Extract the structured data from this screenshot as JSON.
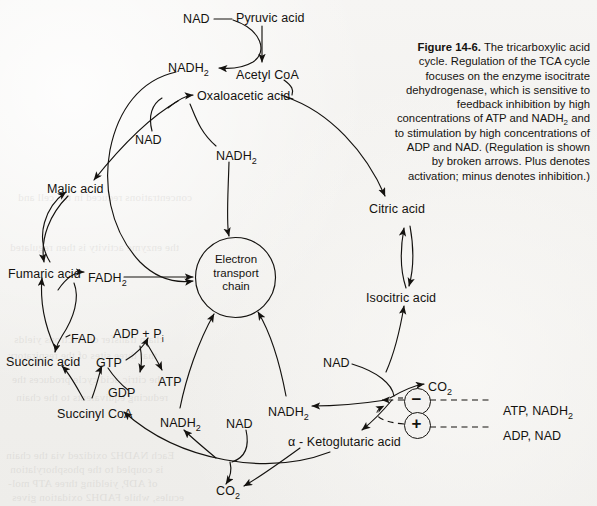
{
  "figure": {
    "number": "Figure 14-6.",
    "caption_rest": " The tricarboxylic acid cycle. Regulation of the TCA cycle focuses on the enzyme isocitrate dehydrogenase, which is sensitive to feedback inhibition by high concentrations of ATP and NADH2 and to stimulation by high concentrations of ADP and NAD. (Regulation is shown by broken arrows. Plus denotes activation; minus denotes inhibition.)",
    "caption_html": "<b>Figure 14-6.</b> The tricarboxylic acid cycle. Regulation of the TCA cycle focuses on the enzyme isocitrate dehydrogenase, which is sensitive to feedback inhibition by high concentrations of ATP and NADH<sub>2</sub> and to stimulation by high concentrations of ADP and NAD. (Regulation is shown by broken arrows. Plus denotes activation; minus denotes inhibition.)"
  },
  "hub": {
    "label_line1": "Electron",
    "label_line2": "transport",
    "label_line3": "chain"
  },
  "metabolites": [
    {
      "id": "pyruvic-acid",
      "text": "Pyruvic acid",
      "x": 236,
      "y": 12,
      "sub": ""
    },
    {
      "id": "nad-pyruvate",
      "text": "NAD",
      "x": 183,
      "y": 13,
      "sub": ""
    },
    {
      "id": "acetyl-coa",
      "text": "Acetyl CoA",
      "x": 236,
      "y": 69,
      "sub": ""
    },
    {
      "id": "nadh2-pyruvate",
      "text": "NADH",
      "x": 168,
      "y": 62,
      "sub": "2"
    },
    {
      "id": "oxaloacetic-acid",
      "text": "Oxaloacetic acid",
      "x": 197,
      "y": 90,
      "sub": ""
    },
    {
      "id": "nad-malate",
      "text": "NAD",
      "x": 135,
      "y": 134,
      "sub": ""
    },
    {
      "id": "nadh2-malate",
      "text": "NADH",
      "x": 216,
      "y": 150,
      "sub": "2"
    },
    {
      "id": "malic-acid",
      "text": "Malic acid",
      "x": 47,
      "y": 183,
      "sub": ""
    },
    {
      "id": "citric-acid",
      "text": "Citric acid",
      "x": 369,
      "y": 203,
      "sub": ""
    },
    {
      "id": "fumaric-acid",
      "text": "Fumaric acid",
      "x": 8,
      "y": 268,
      "sub": ""
    },
    {
      "id": "fadh2",
      "text": "FADH",
      "x": 88,
      "y": 272,
      "sub": "2"
    },
    {
      "id": "isocitric-acid",
      "text": "Isocitric acid",
      "x": 366,
      "y": 292,
      "sub": ""
    },
    {
      "id": "fad",
      "text": "FAD",
      "x": 71,
      "y": 333,
      "sub": ""
    },
    {
      "id": "adp-pi",
      "text": "ADP + P",
      "x": 113,
      "y": 328,
      "sub": "i"
    },
    {
      "id": "succinic-acid",
      "text": "Succinic acid",
      "x": 6,
      "y": 356,
      "sub": ""
    },
    {
      "id": "gtp",
      "text": "GTP",
      "x": 96,
      "y": 357,
      "sub": ""
    },
    {
      "id": "atp",
      "text": "ATP",
      "x": 158,
      "y": 376,
      "sub": ""
    },
    {
      "id": "gdp",
      "text": "GDP",
      "x": 108,
      "y": 387,
      "sub": ""
    },
    {
      "id": "nad-isocitrate",
      "text": "NAD",
      "x": 323,
      "y": 357,
      "sub": ""
    },
    {
      "id": "co2-isocitrate",
      "text": "CO",
      "x": 428,
      "y": 381,
      "sub": "2"
    },
    {
      "id": "succinyl-coa",
      "text": "Succinyl CoA",
      "x": 57,
      "y": 408,
      "sub": ""
    },
    {
      "id": "nadh2-succinyl",
      "text": "NADH",
      "x": 160,
      "y": 417,
      "sub": "2"
    },
    {
      "id": "nad-ketoglutarate",
      "text": "NAD",
      "x": 226,
      "y": 418,
      "sub": ""
    },
    {
      "id": "nadh2-ketoglutarate",
      "text": "NADH",
      "x": 268,
      "y": 406,
      "sub": "2"
    },
    {
      "id": "alpha-ketoglutaric",
      "text": "α - Ketoglutaric acid",
      "x": 288,
      "y": 436,
      "sub": ""
    },
    {
      "id": "co2-ketoglutarate",
      "text": "CO",
      "x": 216,
      "y": 485,
      "sub": "2"
    }
  ],
  "regulation": {
    "inhibition": {
      "sign": "−",
      "label": "ATP, NADH",
      "label_sub": "2",
      "circle_x": 416,
      "circle_y": 400,
      "label_x": 503,
      "label_y": 405
    },
    "activation": {
      "sign": "+",
      "label": "ADP, NAD",
      "label_sub": "",
      "circle_x": 416,
      "circle_y": 424,
      "label_x": 503,
      "label_y": 430
    }
  },
  "showthrough_lines": [
    {
      "x": 18,
      "y": 190,
      "text": "concentrations reduced in the cell and"
    },
    {
      "x": 10,
      "y": 240,
      "text": "the enzyme activity is then regulated"
    },
    {
      "x": 14,
      "y": 332,
      "text": "chain transfer of electrons yields"
    },
    {
      "x": 8,
      "y": 348,
      "text": "that three sites of the respiratory"
    },
    {
      "x": 12,
      "y": 372,
      "text": "the citric acid cycle produces the"
    },
    {
      "x": 16,
      "y": 390,
      "text": "reducing equivalents to the chain"
    },
    {
      "x": 6,
      "y": 448,
      "text": "Each NADH2 oxidized via the chain"
    },
    {
      "x": 10,
      "y": 462,
      "text": "is coupled to the phosphorylation"
    },
    {
      "x": 8,
      "y": 476,
      "text": "of ADP, yielding three ATP mol-"
    },
    {
      "x": 12,
      "y": 490,
      "text": "ecules, while FADH2 oxidation gives"
    }
  ]
}
